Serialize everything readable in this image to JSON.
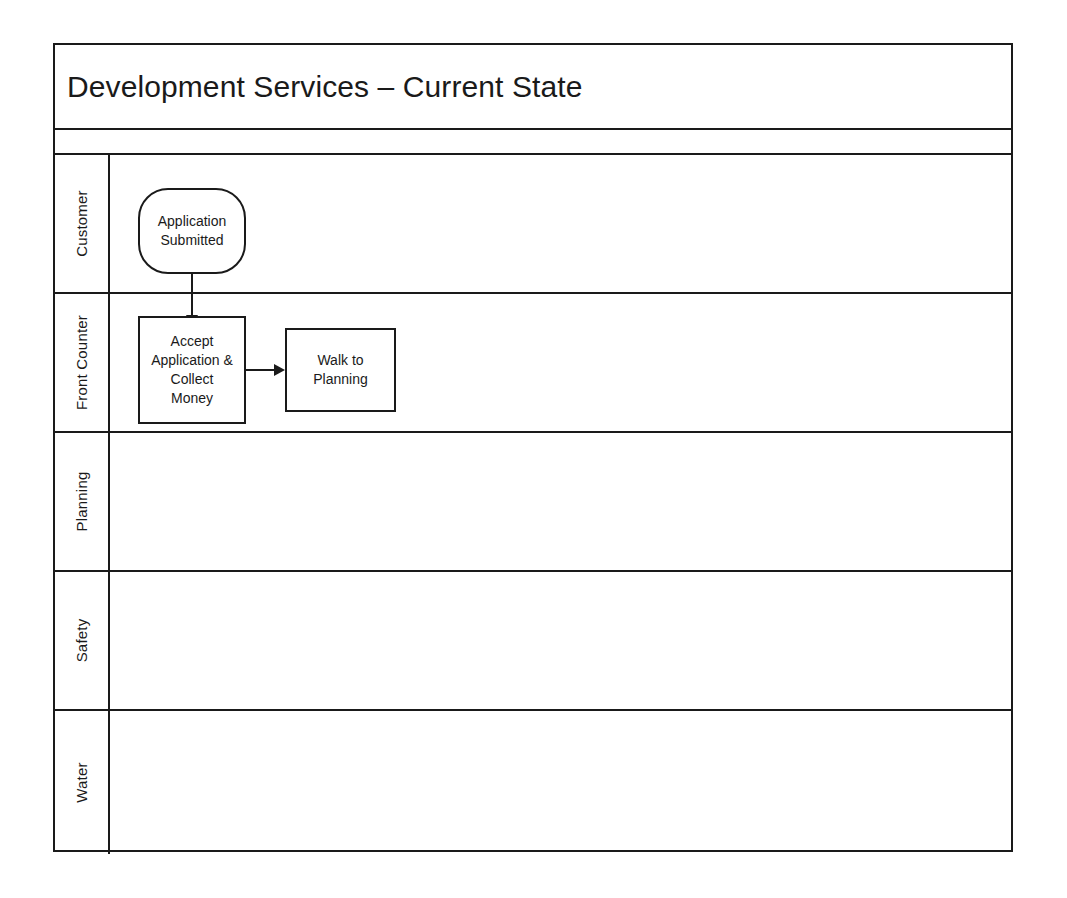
{
  "diagram": {
    "title": "Development Services – Current State",
    "type": "swimlane-flowchart",
    "accent_color": "#1a1a1a",
    "background_color": "#ffffff",
    "lanes": [
      {
        "label": "Customer",
        "shapes": [
          {
            "name": "application-submitted",
            "shape": "terminator",
            "text": "Application\nSubmitted",
            "line1": "Application",
            "line2": "Submitted"
          }
        ]
      },
      {
        "label": "Front Counter",
        "shapes": [
          {
            "name": "accept-application-collect-money",
            "shape": "process",
            "text": "Accept\nApplication &\nCollect\nMoney",
            "line1": "Accept",
            "line2": "Application &",
            "line3": "Collect",
            "line4": "Money"
          },
          {
            "name": "walk-to-planning",
            "shape": "process",
            "text": "Walk to\nPlanning",
            "line1": "Walk to",
            "line2": "Planning"
          }
        ]
      },
      {
        "label": "Planning",
        "shapes": []
      },
      {
        "label": "Safety",
        "shapes": []
      },
      {
        "label": "Water",
        "shapes": []
      }
    ],
    "connectors": [
      {
        "name": "submitted-to-accept",
        "from": "application-submitted",
        "to": "accept-application-collect-money",
        "direction": "down"
      },
      {
        "name": "accept-to-walk",
        "from": "accept-application-collect-money",
        "to": "walk-to-planning",
        "direction": "right"
      }
    ]
  }
}
